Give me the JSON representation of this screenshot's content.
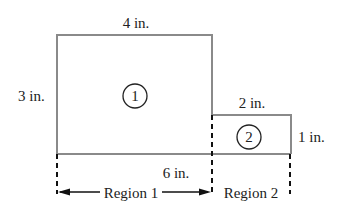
{
  "diagram": {
    "type": "composite-area-figure",
    "colors": {
      "outline": "#8a8a8a",
      "dashed": "#111111",
      "text": "#222222",
      "background": "#ffffff"
    },
    "labels": {
      "top_width": "4 in.",
      "left_height": "3 in.",
      "small_width": "2 in.",
      "small_height": "1 in.",
      "total_width": "6 in.",
      "region1": "Region 1",
      "region2": "Region 2"
    },
    "shapes": [
      {
        "id": "1",
        "label": "1",
        "kind": "rectangle",
        "width_in": 4,
        "height_in": 3
      },
      {
        "id": "2",
        "label": "2",
        "kind": "rectangle",
        "width_in": 2,
        "height_in": 1
      }
    ]
  }
}
